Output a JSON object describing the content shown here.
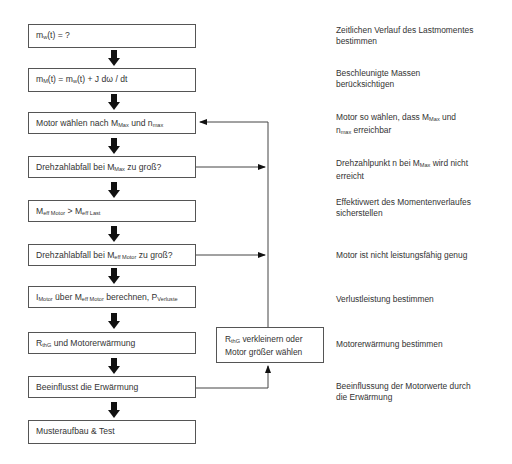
{
  "flow": {
    "steps": [
      {
        "main": "m",
        "sub": "w",
        "rest": "(t) = ?"
      },
      {
        "main": "m",
        "sub": "M",
        "rest": "(t) = m",
        "sub2": "w",
        "rest2": "(t) + J dω / dt"
      },
      {
        "pre": "Motor wählen nach M",
        "sub": "Max",
        "mid": " und n",
        "sub2": "max"
      },
      {
        "pre": "Drehzahlabfall bei M",
        "sub": "Max",
        "mid": " zu groß?"
      },
      {
        "pre": "M",
        "sub": "eff Motor",
        "mid": " > M",
        "sub2": "eff Last"
      },
      {
        "pre": "Drehzahlabfall bei M",
        "sub": "eff Motor",
        "mid": " zu groß?"
      },
      {
        "pre": "I",
        "sub": "Motor",
        "mid": " über M",
        "sub2": "eff Motor",
        "post": " berechnen, P",
        "sub3": "Verluste"
      },
      {
        "pre": "R",
        "sub": "thG",
        "mid": " und Motorerwärmung"
      },
      {
        "pre": "Beeinflusst die Erwärmung"
      },
      {
        "pre": "Musteraufbau & Test"
      }
    ],
    "side_box": {
      "pre": "R",
      "sub": "thG",
      "line1_rest": " verkleinern oder",
      "line2": "Motor größer wählen"
    }
  },
  "notes": [
    {
      "line1": "Zeitlichen Verlauf des Lastmomentes",
      "line2": "bestimmen"
    },
    {
      "line1": "Beschleunigte Massen",
      "line2": "berücksichtigen"
    },
    {
      "line1_pre": "Motor so wählen, dass M",
      "line1_sub": "Max",
      "line1_post": " und",
      "line2_pre": "n",
      "line2_sub": "max",
      "line2_post": " erreichbar"
    },
    {
      "line1_pre": "Drehzahlpunkt n bei M",
      "line1_sub": "Max",
      "line1_post": " wird nicht",
      "line2": "erreicht"
    },
    {
      "line1": "Effektivwert des Momentenverlaufes",
      "line2": "sicherstellen"
    },
    {
      "line1": "Motor ist nicht leistungsfähig genug"
    },
    {
      "line1": "Verlustleistung bestimmen"
    },
    {
      "line1": "Motorerwärmung bestimmen"
    },
    {
      "line1": "Beeinflussung der Motorwerte durch",
      "line2": "die Erwärmung"
    }
  ],
  "colors": {
    "line": "#444444",
    "arrow": "#111111",
    "border": "#555555"
  }
}
